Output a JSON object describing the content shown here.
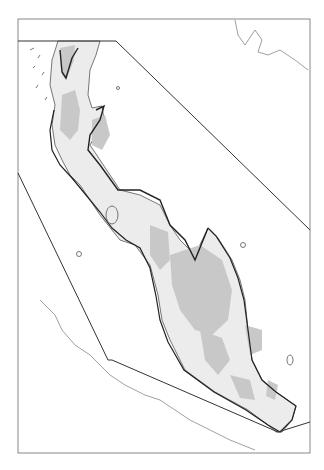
{
  "map": {
    "type": "regional outline map",
    "region": "Thai-Malay Peninsula",
    "labels": [],
    "colors": {
      "background": "#ffffff",
      "frame": "#888888",
      "coastline": "#777777",
      "boundary": "#222222",
      "highland_fill": "#c8c8c8",
      "lowland_fill": "#ececec"
    },
    "frame": {
      "x": 18,
      "y": 19,
      "width": 292,
      "height": 434
    }
  }
}
